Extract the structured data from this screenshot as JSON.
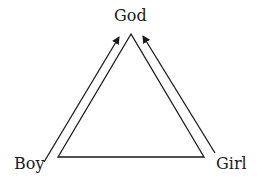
{
  "diagram": {
    "nodes": [
      {
        "id": "god",
        "label": "God",
        "position": "top"
      },
      {
        "id": "boy",
        "label": "Boy",
        "position": "bottom-left"
      },
      {
        "id": "girl",
        "label": "Girl",
        "position": "bottom-right"
      }
    ],
    "edges": [
      {
        "from": "boy",
        "to": "god",
        "type": "arrow"
      },
      {
        "from": "girl",
        "to": "god",
        "type": "arrow"
      }
    ],
    "shape": "triangle",
    "colors": {
      "stroke": "#1a1a1a",
      "background": "#ffffff"
    }
  }
}
